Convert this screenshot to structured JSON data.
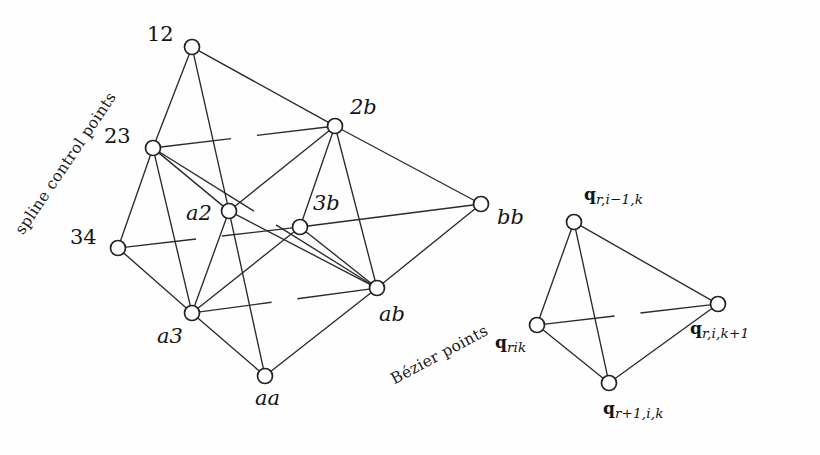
{
  "figure": {
    "background_color": "#fefefe",
    "stroke_color": "#2b2b2b",
    "node_fill": "#ffffff"
  },
  "annotations": {
    "spline_label": "spline control points",
    "bezier_label": "Bézier points"
  },
  "left_net": {
    "name": "spline-control-net",
    "nodes": [
      {
        "id": "n12",
        "label": "12",
        "cx": 192,
        "cy": 47,
        "r": 7.5,
        "label_x": 147,
        "label_y": 24,
        "style": "num"
      },
      {
        "id": "n23",
        "label": "23",
        "cx": 153,
        "cy": 148,
        "r": 7.5,
        "label_x": 104,
        "label_y": 126,
        "style": "num"
      },
      {
        "id": "n34",
        "label": "34",
        "cx": 118,
        "cy": 248,
        "r": 7.5,
        "label_x": 70,
        "label_y": 227,
        "style": "num"
      },
      {
        "id": "n2b",
        "label": "2b",
        "cx": 335,
        "cy": 126,
        "r": 7.5,
        "label_x": 350,
        "label_y": 97,
        "style": "pt"
      },
      {
        "id": "n3b",
        "label": "3b",
        "cx": 300,
        "cy": 227,
        "r": 7.5,
        "label_x": 313,
        "label_y": 193,
        "style": "pt"
      },
      {
        "id": "nbb",
        "label": "bb",
        "cx": 481,
        "cy": 204,
        "r": 7.5,
        "label_x": 497,
        "label_y": 207,
        "style": "pt"
      },
      {
        "id": "na2",
        "label": "a2",
        "cx": 229,
        "cy": 211,
        "r": 7.5,
        "label_x": 186,
        "label_y": 203,
        "style": "pt"
      },
      {
        "id": "na3",
        "label": "a3",
        "cx": 192,
        "cy": 313,
        "r": 7.5,
        "label_x": 157,
        "label_y": 326,
        "style": "pt"
      },
      {
        "id": "nab",
        "label": "ab",
        "cx": 377,
        "cy": 288,
        "r": 7.5,
        "label_x": 379,
        "label_y": 304,
        "style": "pt"
      },
      {
        "id": "naa",
        "label": "aa",
        "cx": 265,
        "cy": 376,
        "r": 7.5,
        "label_x": 255,
        "label_y": 388,
        "style": "pt"
      }
    ],
    "edges": [
      {
        "from": "n12",
        "to": "n23",
        "hidden": false
      },
      {
        "from": "n12",
        "to": "na2",
        "hidden": false
      },
      {
        "from": "n12",
        "to": "n2b",
        "hidden": false
      },
      {
        "from": "n23",
        "to": "n34",
        "hidden": false
      },
      {
        "from": "n23",
        "to": "na2",
        "hidden": false
      },
      {
        "from": "n23",
        "to": "na3",
        "hidden": false
      },
      {
        "from": "n23",
        "to": "n2b",
        "hidden": true
      },
      {
        "from": "n23",
        "to": "nab",
        "hidden": true
      },
      {
        "from": "n34",
        "to": "na3",
        "hidden": false
      },
      {
        "from": "n34",
        "to": "n3b",
        "hidden": true
      },
      {
        "from": "n2b",
        "to": "n3b",
        "hidden": false
      },
      {
        "from": "n2b",
        "to": "na2",
        "hidden": false
      },
      {
        "from": "n2b",
        "to": "nab",
        "hidden": false
      },
      {
        "from": "n2b",
        "to": "nbb",
        "hidden": false
      },
      {
        "from": "n3b",
        "to": "nab",
        "hidden": false
      },
      {
        "from": "n3b",
        "to": "nbb",
        "hidden": false
      },
      {
        "from": "nab",
        "to": "nbb",
        "hidden": false
      },
      {
        "from": "na2",
        "to": "na3",
        "hidden": false
      },
      {
        "from": "na2",
        "to": "naa",
        "hidden": false
      },
      {
        "from": "na2",
        "to": "nab",
        "hidden": false
      },
      {
        "from": "na3",
        "to": "naa",
        "hidden": false
      },
      {
        "from": "na3",
        "to": "nab",
        "hidden": true
      },
      {
        "from": "na3",
        "to": "n3b",
        "hidden": false
      },
      {
        "from": "naa",
        "to": "nab",
        "hidden": false
      }
    ]
  },
  "right_net": {
    "name": "bezier-tetrahedron",
    "nodes": [
      {
        "id": "qt",
        "cx": 574,
        "cy": 222,
        "r": 7.5
      },
      {
        "id": "qr",
        "cx": 718,
        "cy": 304,
        "r": 7.5
      },
      {
        "id": "ql",
        "cx": 537,
        "cy": 325,
        "r": 7.5
      },
      {
        "id": "qb",
        "cx": 609,
        "cy": 383,
        "r": 7.5
      }
    ],
    "edges": [
      {
        "from": "qt",
        "to": "qr",
        "hidden": false
      },
      {
        "from": "qt",
        "to": "ql",
        "hidden": false
      },
      {
        "from": "qt",
        "to": "qb",
        "hidden": false
      },
      {
        "from": "ql",
        "to": "qb",
        "hidden": false
      },
      {
        "from": "qr",
        "to": "qb",
        "hidden": false
      },
      {
        "from": "ql",
        "to": "qr",
        "hidden": true
      }
    ],
    "labels": [
      {
        "id": "lbl-q-top",
        "base": "q",
        "sub": "r,i−1,k",
        "x": 584,
        "y": 186
      },
      {
        "id": "lbl-q-right",
        "base": "q",
        "sub": "r,i,k+1",
        "x": 690,
        "y": 320
      },
      {
        "id": "lbl-q-left",
        "base": "q",
        "sub": "rik",
        "x": 495,
        "y": 334
      },
      {
        "id": "lbl-q-bottom",
        "base": "q",
        "sub": "r+1,i,k",
        "x": 603,
        "y": 400
      }
    ]
  }
}
